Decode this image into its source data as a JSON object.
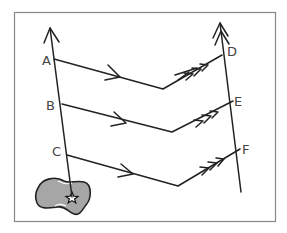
{
  "diagram": {
    "type": "plate-motion / flow-line diagram",
    "labels": {
      "A": "A",
      "B": "B",
      "C": "C",
      "D": "D",
      "E": "E",
      "F": "F"
    },
    "colors": {
      "line": "#222222",
      "frame": "#888888",
      "blob_fill": "#a6a6a6",
      "label": "#444444"
    },
    "paths": [
      {
        "from": "A",
        "to": "D",
        "first_segment_arrows": 1,
        "second_segment_arrows": 3
      },
      {
        "from": "B",
        "to": "E",
        "first_segment_arrows": 1,
        "second_segment_arrows": 3
      },
      {
        "from": "C",
        "to": "F",
        "first_segment_arrows": 1,
        "second_segment_arrows": 3
      }
    ],
    "left_line": {
      "points": [
        "A",
        "B",
        "C"
      ],
      "arrow": "up",
      "origin_marker": "star-on-blob"
    },
    "right_line": {
      "points": [
        "D",
        "E",
        "F"
      ],
      "arrow": "up"
    }
  }
}
